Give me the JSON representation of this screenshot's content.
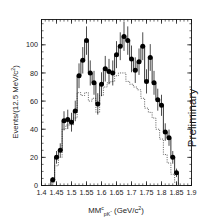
{
  "figure": {
    "preliminary_label": "Preliminary",
    "background": "#ffffff",
    "foreground": "#111111"
  },
  "chart_data": {
    "type": "line",
    "title": "",
    "subtitle": "",
    "xlabel": "MM_{pK^-}^{c} (GeV/c^2)",
    "xlabel_parts": {
      "base": "MM",
      "superscript": "c",
      "subscript": "pK",
      "subscript_sup": "-",
      "units": "(GeV/c",
      "units_sup": "2",
      "units_close": ")"
    },
    "ylabel": "Events/(12.5 MeV/c^2)",
    "ylabel_parts": {
      "base": "Events/(12.5 MeV/c",
      "superscript": "2",
      "close": ")"
    },
    "xlim": [
      1.4,
      1.9
    ],
    "ylim": [
      0,
      118
    ],
    "xticks": [
      1.4,
      1.45,
      1.5,
      1.55,
      1.6,
      1.65,
      1.7,
      1.75,
      1.8,
      1.85,
      1.9
    ],
    "xticklabels": [
      "1.4",
      "1.45",
      "1.5",
      "1.55",
      "1.6",
      "1.65",
      "1.7",
      "1.75",
      "1.8",
      "1.85",
      "1.9"
    ],
    "yticks": [
      0,
      20,
      40,
      60,
      80,
      100
    ],
    "yticklabels": [
      "0",
      "20",
      "40",
      "60",
      "80",
      "100"
    ],
    "xminor_step": 0.0125,
    "yminor_step": 5,
    "grid": false,
    "legend": "none",
    "bin_width": 0.0125,
    "bin_centers": [
      1.4375,
      1.45,
      1.4625,
      1.475,
      1.4875,
      1.5,
      1.5125,
      1.525,
      1.5375,
      1.55,
      1.5625,
      1.575,
      1.5875,
      1.6,
      1.6125,
      1.625,
      1.6375,
      1.65,
      1.6625,
      1.675,
      1.6875,
      1.7,
      1.7125,
      1.725,
      1.7375,
      1.75,
      1.7625,
      1.775,
      1.7875,
      1.8,
      1.8125,
      1.825,
      1.8375,
      1.85
    ],
    "series": [
      {
        "name": "data",
        "style": "points-with-errorbars-and-step",
        "marker": "filled-circle",
        "color": "#000000",
        "values": [
          4,
          20,
          25,
          46,
          47,
          45,
          53,
          78,
          89,
          103,
          80,
          73,
          58,
          72,
          83,
          81,
          80,
          93,
          99,
          106,
          103,
          90,
          82,
          88,
          99,
          74,
          91,
          73,
          61,
          57,
          38,
          34,
          20,
          9
        ],
        "errors": [
          2,
          4.5,
          5,
          6.8,
          6.9,
          6.7,
          7.3,
          8.8,
          9.4,
          10.1,
          8.9,
          8.5,
          7.6,
          8.5,
          9.1,
          9.0,
          8.9,
          9.6,
          9.9,
          10.3,
          10.1,
          9.5,
          9.1,
          9.4,
          9.9,
          8.6,
          9.5,
          8.5,
          7.8,
          7.5,
          6.2,
          5.8,
          4.5,
          3.0
        ]
      },
      {
        "name": "background",
        "style": "dotted-step",
        "color": "#3a3a3a",
        "values": [
          2,
          14,
          20,
          40,
          43,
          43,
          48,
          66,
          64,
          66,
          60,
          62,
          52,
          64,
          70,
          73,
          74,
          78,
          80,
          80,
          74,
          72,
          70,
          68,
          62,
          55,
          52,
          48,
          40,
          33,
          22,
          16,
          8,
          2
        ]
      }
    ],
    "annotations": [
      {
        "text": "Preliminary",
        "rotation": -90,
        "x": 1.875,
        "y": 60
      }
    ]
  }
}
